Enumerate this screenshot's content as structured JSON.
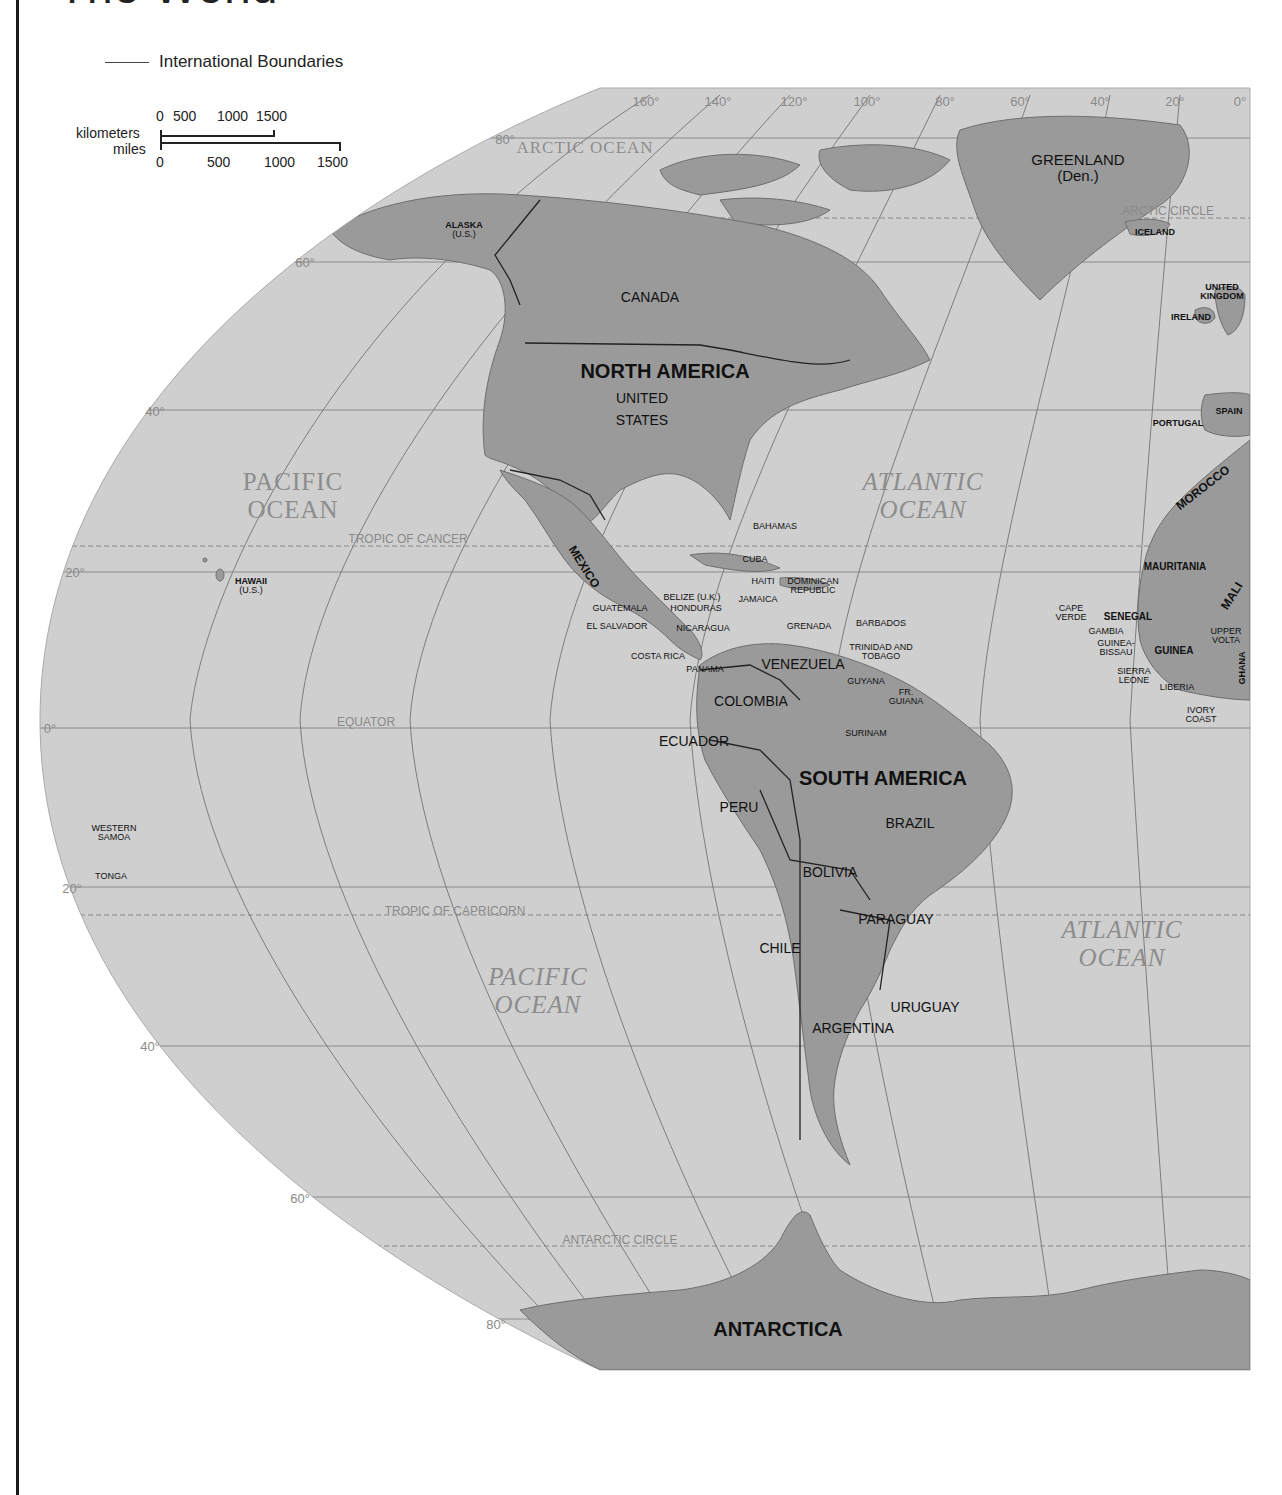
{
  "page": {
    "title": "The World"
  },
  "legend": {
    "boundary_label": "International Boundaries"
  },
  "scale": {
    "km_label": "kilometers",
    "mi_label": "miles",
    "km_ticks": [
      "0",
      "500",
      "1000",
      "1500"
    ],
    "mi_ticks": [
      "0",
      "500",
      "1000",
      "1500"
    ]
  },
  "colors": {
    "ocean": "#cfcfcf",
    "land": "#9a9a9a",
    "grid": "#7d7d7d",
    "text": "#111111",
    "ocean_text": "#8c8c8c"
  },
  "graticule": {
    "longitudes": [
      "160°",
      "140°",
      "120°",
      "100°",
      "80°",
      "60°",
      "40°",
      "20°",
      "0°"
    ],
    "latitudes": [
      "80°",
      "60°",
      "40°",
      "20°",
      "0°",
      "20°",
      "40°",
      "60°",
      "80°"
    ]
  },
  "reference_lines": {
    "arctic_circle": "ARCTIC CIRCLE",
    "tropic_cancer": "TROPIC OF CANCER",
    "equator": "EQUATOR",
    "tropic_capricorn": "TROPIC OF CAPRICORN",
    "antarctic_circle": "ANTARCTIC   CIRCLE"
  },
  "oceans": {
    "arctic": "ARCTIC OCEAN",
    "pacific_north": [
      "PACIFIC",
      "OCEAN"
    ],
    "atlantic_north": [
      "ATLANTIC",
      "OCEAN"
    ],
    "pacific_south": [
      "PACIFIC",
      "OCEAN"
    ],
    "atlantic_south": [
      "ATLANTIC",
      "OCEAN"
    ]
  },
  "continents": {
    "north_america": "NORTH AMERICA",
    "south_america": "SOUTH AMERICA",
    "antarctica": "ANTARCTICA"
  },
  "countries": {
    "greenland": [
      "GREENLAND",
      "(Den.)"
    ],
    "alaska": [
      "ALASKA",
      "(U.S.)"
    ],
    "canada": "CANADA",
    "united_states": [
      "UNITED",
      "STATES"
    ],
    "iceland": "ICELAND",
    "united_kingdom": [
      "UNITED",
      "KINGDOM"
    ],
    "ireland": "IRELAND",
    "portugal": "PORTUGAL",
    "spain": "SPAIN",
    "morocco": "MOROCCO",
    "mauritania": "MAURITANIA",
    "mali": "MALI",
    "cape_verde": [
      "CAPE",
      "VERDE"
    ],
    "senegal": "SENEGAL",
    "gambia": "GAMBIA",
    "guinea_bissau": [
      "GUINEA-",
      "BISSAU"
    ],
    "guinea": "GUINEA",
    "upper_volta": [
      "UPPER",
      "VOLTA"
    ],
    "ghana": "GHANA",
    "sierra_leone": [
      "SIERRA",
      "LEONE"
    ],
    "liberia": "LIBERIA",
    "ivory_coast": [
      "IVORY",
      "COAST"
    ],
    "hawaii": [
      "HAWAII",
      "(U.S.)"
    ],
    "mexico": "MEXICO",
    "bahamas": "BAHAMAS",
    "cuba": "CUBA",
    "haiti": "HAITI",
    "dominican_republic": [
      "DOMINICAN",
      "REPUBLIC"
    ],
    "jamaica": "JAMAICA",
    "belize": "BELIZE (U.K.)",
    "guatemala": "GUATEMALA",
    "honduras": "HONDURAS",
    "el_salvador": "EL SALVADOR",
    "nicaragua": "NICARAGUA",
    "costa_rica": "COSTA RICA",
    "panama": "PANAMA",
    "grenada": "GRENADA",
    "barbados": "BARBADOS",
    "trinidad": [
      "TRINIDAD AND",
      "TOBAGO"
    ],
    "venezuela": "VENEZUELA",
    "guyana": "GUYANA",
    "fr_guiana": [
      "FR.",
      "GUIANA"
    ],
    "surinam": "SURINAM",
    "colombia": "COLOMBIA",
    "ecuador": "ECUADOR",
    "peru": "PERU",
    "brazil": "BRAZIL",
    "bolivia": "BOLIVIA",
    "paraguay": "PARAGUAY",
    "chile": "CHILE",
    "uruguay": "URUGUAY",
    "argentina": "ARGENTINA",
    "western_samoa": [
      "WESTERN",
      "SAMOA"
    ],
    "tonga": "TONGA"
  }
}
